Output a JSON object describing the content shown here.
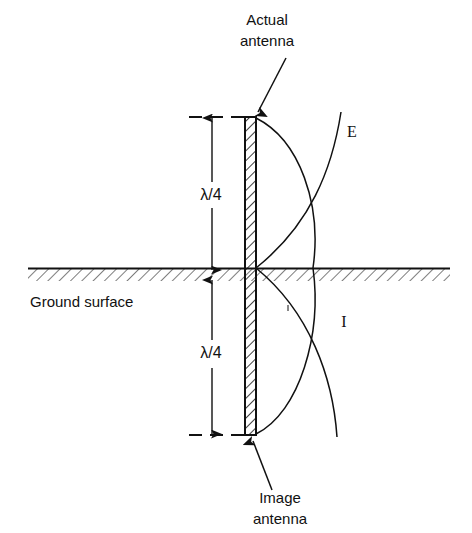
{
  "figure": {
    "title_top": "Actual antenna",
    "title_bottom": "Image antenna",
    "ground_label": "Ground surface",
    "dimension_upper": "λ/4",
    "dimension_lower": "λ/4",
    "curve_label_e": "E",
    "curve_label_i": "I",
    "labels": {
      "actual_line1": "Actual",
      "actual_line2": "antenna",
      "image_line1": "Image",
      "image_line2": "antenna"
    }
  },
  "colors": {
    "stroke": "#111111",
    "background": "#ffffff",
    "hatch": "#111111"
  },
  "geometry": {
    "antenna_x_left": 245,
    "antenna_x_right": 256,
    "antenna_top_y": 117,
    "antenna_bottom_y": 435,
    "ground_y": 268,
    "ground_x_start": 28,
    "ground_x_end": 450,
    "dimension_line_x": 212,
    "quarter_wave_px": 151
  }
}
